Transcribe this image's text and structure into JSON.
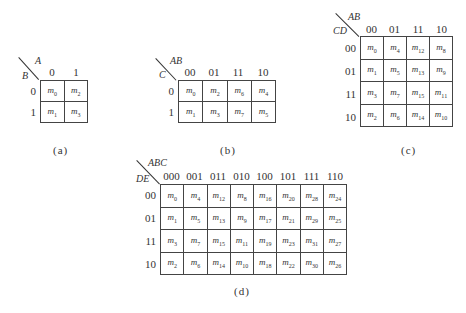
{
  "maps": [
    {
      "id": "a",
      "caption": "(a)",
      "col_var": "A",
      "row_var": "B",
      "col_labels": [
        "0",
        "1"
      ],
      "row_labels": [
        "0",
        "1"
      ],
      "cells": [
        [
          "0",
          "2"
        ],
        [
          "1",
          "3"
        ]
      ]
    },
    {
      "id": "b",
      "caption": "(b)",
      "col_var": "AB",
      "row_var": "C",
      "col_labels": [
        "00",
        "01",
        "11",
        "10"
      ],
      "row_labels": [
        "0",
        "1"
      ],
      "cells": [
        [
          "0",
          "2",
          "6",
          "4"
        ],
        [
          "1",
          "3",
          "7",
          "5"
        ]
      ]
    },
    {
      "id": "c",
      "caption": "(c)",
      "col_var": "AB",
      "row_var": "CD",
      "col_labels": [
        "00",
        "01",
        "11",
        "10"
      ],
      "row_labels": [
        "00",
        "01",
        "11",
        "10"
      ],
      "cells": [
        [
          "0",
          "4",
          "12",
          "8"
        ],
        [
          "1",
          "5",
          "13",
          "9"
        ],
        [
          "3",
          "7",
          "15",
          "11"
        ],
        [
          "2",
          "6",
          "14",
          "10"
        ]
      ]
    },
    {
      "id": "d",
      "caption": "(d)",
      "col_var": "ABC",
      "row_var": "DE",
      "col_labels": [
        "000",
        "001",
        "011",
        "010",
        "100",
        "101",
        "111",
        "110"
      ],
      "row_labels": [
        "00",
        "01",
        "11",
        "10"
      ],
      "cells": [
        [
          "0",
          "4",
          "12",
          "8",
          "16",
          "20",
          "28",
          "24"
        ],
        [
          "1",
          "5",
          "13",
          "9",
          "17",
          "21",
          "29",
          "25"
        ],
        [
          "3",
          "7",
          "15",
          "11",
          "19",
          "23",
          "31",
          "27"
        ],
        [
          "2",
          "6",
          "14",
          "10",
          "18",
          "22",
          "30",
          "26"
        ]
      ]
    }
  ],
  "cell_prefix": "m"
}
